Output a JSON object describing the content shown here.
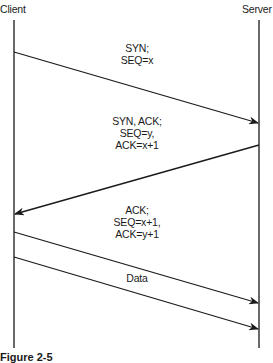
{
  "actors": {
    "client": "Client",
    "server": "Server"
  },
  "messages": [
    {
      "lines": [
        "SYN;",
        "SEQ=x"
      ],
      "from": "client",
      "to": "server"
    },
    {
      "lines": [
        "SYN, ACK;",
        "SEQ=y,",
        "ACK=x+1"
      ],
      "from": "server",
      "to": "client"
    },
    {
      "lines": [
        "ACK;",
        "SEQ=x+1,",
        "ACK=y+1"
      ],
      "from": "client",
      "to": "server"
    },
    {
      "lines": [
        "Data"
      ],
      "from": "client",
      "to": "server"
    }
  ],
  "caption": "Figure 2-5",
  "colors": {
    "line": "#1a1a1a",
    "background": "#ffffff"
  }
}
